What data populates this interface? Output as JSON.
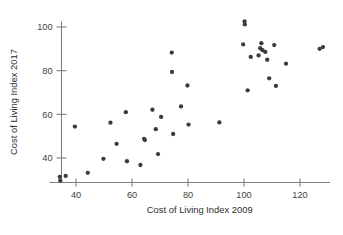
{
  "chart_data": {
    "type": "scatter",
    "title": "",
    "xlabel": "Cost of Living Index 2009",
    "ylabel": "Cost of Living Index 2017",
    "xlim": [
      32,
      131
    ],
    "ylim": [
      28,
      105
    ],
    "xticks": [
      40,
      60,
      80,
      100,
      120
    ],
    "yticks": [
      40,
      60,
      80,
      100
    ],
    "xtick_labels": [
      "40",
      "60",
      "80",
      "100",
      "120"
    ],
    "ytick_labels": [
      "40",
      "60",
      "80",
      "100"
    ],
    "grid": false,
    "legend": null,
    "marker": "filled-circle",
    "marker_color": "#3b3b3b",
    "points": [
      {
        "x": 34.2,
        "y": 31.4
      },
      {
        "x": 34.4,
        "y": 29.6
      },
      {
        "x": 36.3,
        "y": 31.8
      },
      {
        "x": 39.6,
        "y": 54.4
      },
      {
        "x": 44.2,
        "y": 33.2
      },
      {
        "x": 49.8,
        "y": 39.6
      },
      {
        "x": 52.3,
        "y": 56.2
      },
      {
        "x": 54.5,
        "y": 46.5
      },
      {
        "x": 57.8,
        "y": 61.0
      },
      {
        "x": 58.2,
        "y": 38.5
      },
      {
        "x": 63.0,
        "y": 36.8
      },
      {
        "x": 64.3,
        "y": 48.8
      },
      {
        "x": 64.6,
        "y": 48.2
      },
      {
        "x": 67.3,
        "y": 62.1
      },
      {
        "x": 68.5,
        "y": 53.2
      },
      {
        "x": 69.3,
        "y": 41.8
      },
      {
        "x": 70.4,
        "y": 58.8
      },
      {
        "x": 74.2,
        "y": 88.3
      },
      {
        "x": 74.3,
        "y": 79.4
      },
      {
        "x": 74.7,
        "y": 51.0
      },
      {
        "x": 77.5,
        "y": 63.6
      },
      {
        "x": 79.8,
        "y": 73.2
      },
      {
        "x": 80.2,
        "y": 55.3
      },
      {
        "x": 91.2,
        "y": 56.3
      },
      {
        "x": 99.7,
        "y": 92.0
      },
      {
        "x": 100.2,
        "y": 102.6
      },
      {
        "x": 100.3,
        "y": 101.2
      },
      {
        "x": 101.3,
        "y": 71.0
      },
      {
        "x": 102.4,
        "y": 86.3
      },
      {
        "x": 105.2,
        "y": 87.0
      },
      {
        "x": 105.8,
        "y": 90.3
      },
      {
        "x": 106.2,
        "y": 92.6
      },
      {
        "x": 106.6,
        "y": 89.4
      },
      {
        "x": 107.6,
        "y": 88.6
      },
      {
        "x": 108.3,
        "y": 85.0
      },
      {
        "x": 109.0,
        "y": 76.5
      },
      {
        "x": 110.8,
        "y": 91.7
      },
      {
        "x": 111.4,
        "y": 73.0
      },
      {
        "x": 115.0,
        "y": 83.2
      },
      {
        "x": 127.0,
        "y": 90.0
      },
      {
        "x": 128.2,
        "y": 90.8
      }
    ]
  },
  "axes": {
    "x_title": "Cost of Living Index 2009",
    "y_title": "Cost of Living Index 2017"
  }
}
